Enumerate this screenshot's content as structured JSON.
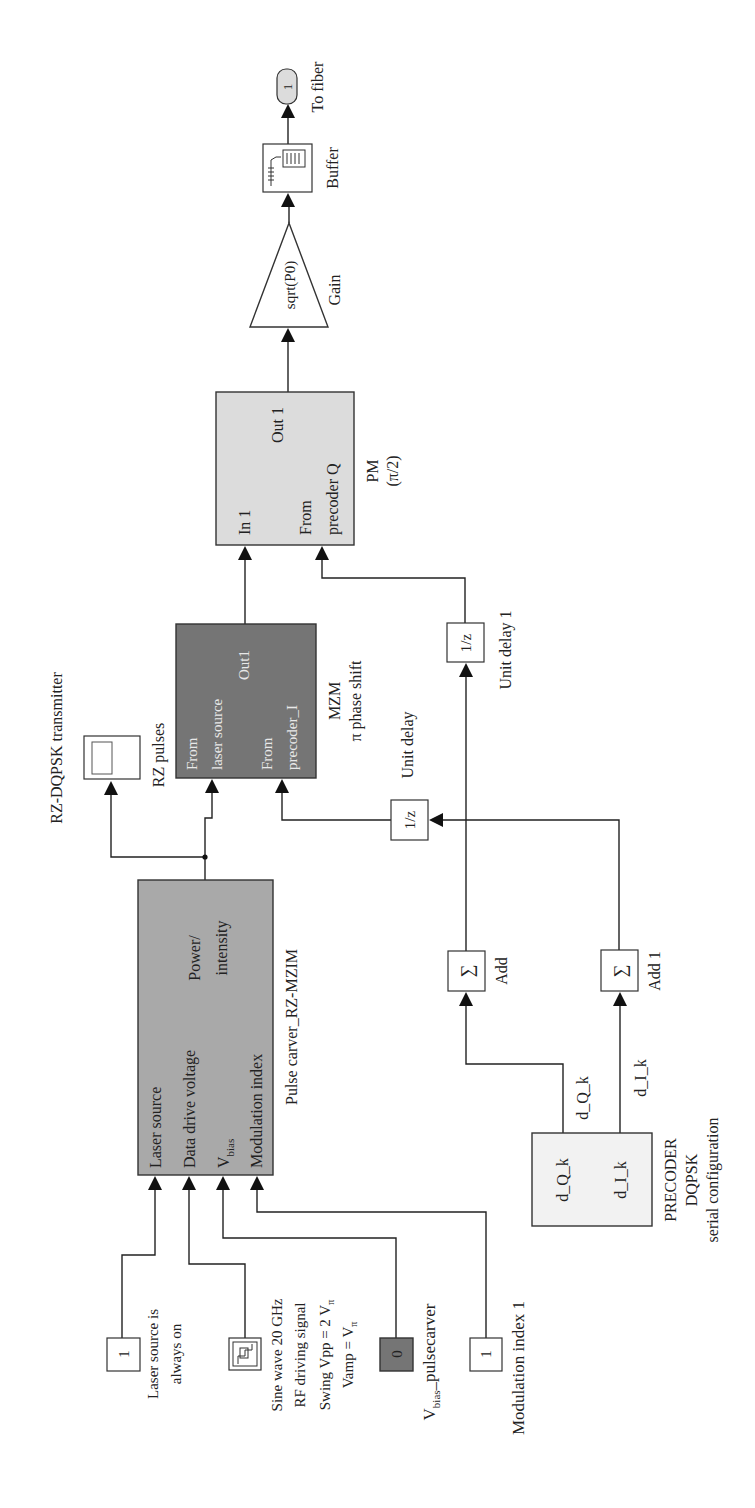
{
  "diagram": {
    "title": "RZ-DQPSK transmitter",
    "orientation": "rotated 90 degrees counter-clockwise",
    "blocks": {
      "laser_const": {
        "value": "1",
        "caption_l1": "Laser source is",
        "caption_l2": "always on"
      },
      "sine_wave": {
        "icon": "signal-generator-icon",
        "caption_l1": "Sine wave 20 GHz",
        "caption_l2": "RF driving signal",
        "caption_l3": "Swing Vpp = 2 V",
        "caption_l3_sub": "π",
        "caption_l4": "Vamp = V",
        "caption_l4_sub": "π"
      },
      "vbias_const": {
        "value": "0",
        "caption_main": "V",
        "caption_sub": "bias",
        "caption_rest": "_pulsecarver"
      },
      "mod_const": {
        "value": "1",
        "caption": "Modulation index 1"
      },
      "pulse_carver": {
        "caption": "Pulse carver_RZ-MZIM",
        "ports_in": [
          "Laser source",
          "Data drive voltage",
          "V",
          "Modulation index"
        ],
        "port_vbias_sub": "bias",
        "port_out_l1": "Power/",
        "port_out_l2": "intensity"
      },
      "scope": {
        "caption": "RZ pulses",
        "icon": "scope-icon"
      },
      "mzm": {
        "caption_l1": "MZM",
        "caption_l2": "π phase shift",
        "in1_l1": "From",
        "in1_l2": "laser source",
        "in2_l1": "From",
        "in2_l2": "precoder_I",
        "out": "Out1"
      },
      "pm": {
        "caption_l1": "PM",
        "caption_l2": "(π/2)",
        "in1": "In 1",
        "in2_l1": "From",
        "in2_l2": "precoder Q",
        "out": "Out 1"
      },
      "gain": {
        "value": "sqrt(P0)",
        "caption": "Gain"
      },
      "buffer": {
        "caption": "Buffer",
        "icon": "buffer-icon"
      },
      "outport": {
        "value": "1",
        "caption": "To fiber"
      },
      "unit_delay": {
        "value": "1/z",
        "caption": "Unit delay"
      },
      "unit_delay_1": {
        "value": "1/z",
        "caption": "Unit delay 1"
      },
      "add": {
        "symbol": "∑",
        "caption": "Add"
      },
      "add_1": {
        "symbol": "∑",
        "caption": "Add 1"
      },
      "precoder": {
        "caption_l1": "PRECODER",
        "caption_l2": "DQPSK",
        "caption_l3": "serial configuration",
        "out_q": "d_Q_k",
        "out_i": "d_I_k"
      }
    },
    "signals": {
      "d_q_k": "d_Q_k",
      "d_i_k": "d_I_k"
    },
    "colors": {
      "pulse_carver_fill": "#a9a9a9",
      "mzm_fill": "#757575",
      "pm_fill": "#dcdcdc",
      "vbias_fill": "#757575",
      "outport_fill": "#dcdcdc",
      "wire": "#222222"
    }
  }
}
